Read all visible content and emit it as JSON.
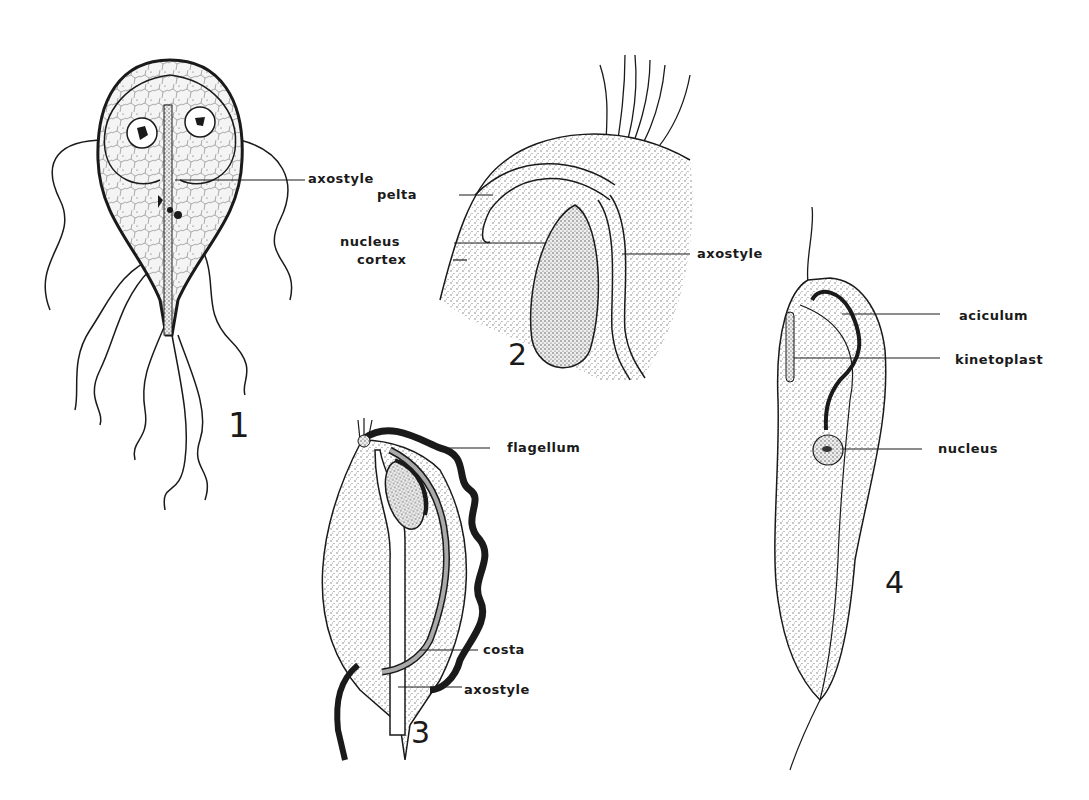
{
  "figure": {
    "panels": [
      {
        "number": "1",
        "labels": [
          "axostyle"
        ]
      },
      {
        "number": "2",
        "labels": [
          "pelta",
          "nucleus",
          "cortex",
          "axostyle"
        ]
      },
      {
        "number": "3",
        "labels": [
          "flagellum",
          "costa",
          "axostyle"
        ]
      },
      {
        "number": "4",
        "labels": [
          "aciculum",
          "kinetoplast",
          "nucleus"
        ]
      }
    ]
  },
  "colors": {
    "ink": "#1a1a1a",
    "stipple": "#8a8a8a",
    "background": "#ffffff"
  }
}
